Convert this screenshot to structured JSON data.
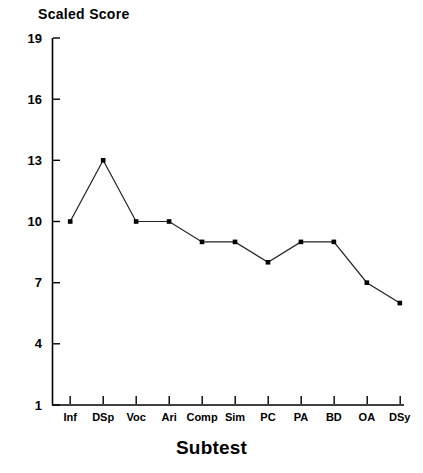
{
  "chart_data": {
    "type": "line",
    "title": "",
    "ylabel": "Scaled Score",
    "xlabel": "Subtest",
    "categories": [
      "Inf",
      "DSp",
      "Voc",
      "Ari",
      "Comp",
      "Sim",
      "PC",
      "PA",
      "BD",
      "OA",
      "DSy"
    ],
    "values": [
      10,
      13,
      10,
      10,
      9,
      9,
      8,
      9,
      9,
      7,
      6
    ],
    "series": [
      {
        "name": "Scaled Score",
        "values": [
          10,
          13,
          10,
          10,
          9,
          9,
          8,
          9,
          9,
          7,
          6
        ]
      }
    ],
    "ylim": [
      1,
      19
    ],
    "yticks": [
      1,
      4,
      7,
      10,
      13,
      16,
      19
    ],
    "ytick_labels": [
      "1",
      "4",
      "7",
      "10",
      "13",
      "16",
      "19"
    ],
    "grid": false,
    "legend": "none",
    "marker": "square",
    "line_color": "#1a1a1a",
    "marker_color": "#000000",
    "axis_color": "#000000"
  }
}
